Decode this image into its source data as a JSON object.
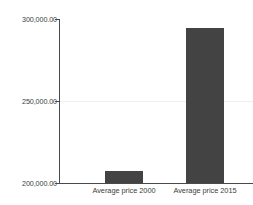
{
  "chart_data": {
    "type": "bar",
    "title": "",
    "subtitle": "",
    "xlabel": "",
    "ylabel": "",
    "categories": [
      "Average price 2000",
      "Average price 2015"
    ],
    "values": [
      207300,
      294500
    ],
    "series": [
      {
        "name": "Average price",
        "values": [
          207300,
          294500
        ]
      }
    ],
    "ylim": [
      200000,
      300000
    ],
    "yticks": [
      200000,
      250000,
      300000
    ],
    "ytick_labels": [
      "200,000.00",
      "250,000.00",
      "300,000.00"
    ],
    "grid": true,
    "grid_axis": "y",
    "legend": false,
    "legend_position": "none",
    "bar_color": "#434343",
    "axis_color": "#4a4a4a",
    "gridline_color": "#f0eeee",
    "background_color": "#ffffff",
    "text_color": "#3d3d3d"
  },
  "axis": {
    "y_labels": {
      "top": "300,000.00",
      "middle": "250,000.00",
      "bottom": "200,000.00"
    }
  },
  "bars": [
    {
      "label": "Average price 2000",
      "value": 207300
    },
    {
      "label": "Average price 2015",
      "value": 294500
    }
  ]
}
